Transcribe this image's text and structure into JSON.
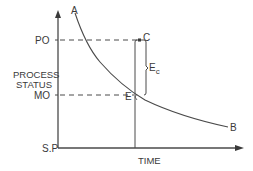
{
  "diagram": {
    "type": "process-status-vs-time",
    "axes": {
      "y_label_line1": "PROCESS",
      "y_label_line2": "STATUS",
      "x_label": "TIME"
    },
    "levels": {
      "po": "PO",
      "mo": "MO",
      "sp": "S.P"
    },
    "points": {
      "a": "A",
      "b": "B",
      "c": "C",
      "e": "E"
    },
    "error_label": {
      "main": "E",
      "subscript": "c"
    },
    "colors": {
      "line": "#4a4a4a",
      "text": "#3a3a3a",
      "background": "#ffffff"
    }
  }
}
